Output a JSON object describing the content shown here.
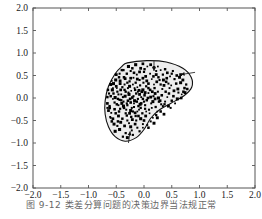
{
  "figure": {
    "background_color": "#ffffff",
    "frame_color": "#555555",
    "region_fill_color": "#ededed",
    "region_stroke_color": "#111111",
    "point_color": "#000000",
    "arrow_color": "#111111"
  },
  "caption": {
    "text": "图 9-12  类差分算问题的决策边界当法规正常"
  },
  "chart_data": {
    "type": "scatter",
    "title": "",
    "xlabel": "",
    "ylabel": "",
    "xlim": [
      -2.0,
      2.0
    ],
    "ylim": [
      -2.0,
      2.0
    ],
    "grid": false,
    "legend": "none",
    "xticks": [
      -2.0,
      -1.5,
      -1.0,
      -0.5,
      0.0,
      0.5,
      1.0,
      1.5,
      2.0
    ],
    "yticks": [
      -2.0,
      -1.5,
      -1.0,
      -0.5,
      0.0,
      0.5,
      1.0,
      1.5,
      2.0
    ],
    "xticklabels": [
      "-2.0",
      "-1.5",
      "-1.0",
      "-0.5",
      "0.0",
      "0.5",
      "1.0",
      "1.5",
      "2.0"
    ],
    "yticklabels": [
      "-2.0",
      "-1.5",
      "-1.0",
      "-0.5",
      "0.0",
      "0.5",
      "1.0",
      "1.5",
      "2.0"
    ],
    "annotations": [
      {
        "name": "boundary-arrow-top",
        "x": 0.18,
        "y": 0.82,
        "dx": 0.0,
        "dy": -0.22
      },
      {
        "name": "boundary-arrow-right",
        "x": 0.92,
        "y": 0.57,
        "dx": -0.26,
        "dy": -0.05
      },
      {
        "name": "boundary-arrow-bottom",
        "x": -0.28,
        "y": -1.0,
        "dx": 0.03,
        "dy": 0.26
      }
    ],
    "region": {
      "name": "decision-region",
      "shape": "kidney",
      "fill": "#ededed",
      "outline_points": [
        [
          -0.3,
          0.78
        ],
        [
          0.05,
          0.83
        ],
        [
          0.4,
          0.8
        ],
        [
          0.7,
          0.66
        ],
        [
          0.85,
          0.46
        ],
        [
          0.86,
          0.24
        ],
        [
          0.72,
          0.05
        ],
        [
          0.48,
          -0.12
        ],
        [
          0.28,
          -0.26
        ],
        [
          0.12,
          -0.45
        ],
        [
          0.0,
          -0.7
        ],
        [
          -0.14,
          -0.88
        ],
        [
          -0.34,
          -0.96
        ],
        [
          -0.52,
          -0.86
        ],
        [
          -0.64,
          -0.64
        ],
        [
          -0.7,
          -0.36
        ],
        [
          -0.7,
          -0.06
        ],
        [
          -0.64,
          0.26
        ],
        [
          -0.52,
          0.54
        ],
        [
          -0.4,
          0.7
        ]
      ]
    },
    "series": [
      {
        "name": "samples",
        "marker": "square",
        "color": "#000000",
        "count": 252,
        "points": [
          [
            -0.24,
            -0.1
          ],
          [
            -0.17,
            -0.06
          ],
          [
            -0.11,
            -0.02
          ],
          [
            -0.05,
            0.02
          ],
          [
            0.01,
            0.06
          ],
          [
            -0.3,
            -0.16
          ],
          [
            -0.21,
            0.01
          ],
          [
            -0.14,
            0.1
          ],
          [
            -0.07,
            -0.14
          ],
          [
            0.05,
            -0.05
          ],
          [
            -0.36,
            -0.22
          ],
          [
            -0.27,
            0.08
          ],
          [
            -0.18,
            -0.2
          ],
          [
            -0.09,
            0.17
          ],
          [
            0.08,
            0.11
          ],
          [
            -0.41,
            -0.05
          ],
          [
            -0.33,
            0.14
          ],
          [
            -0.24,
            -0.28
          ],
          [
            -0.12,
            0.24
          ],
          [
            0.13,
            -0.12
          ],
          [
            -0.45,
            -0.3
          ],
          [
            -0.38,
            0.02
          ],
          [
            -0.29,
            0.22
          ],
          [
            -0.16,
            -0.33
          ],
          [
            0.17,
            0.04
          ],
          [
            -0.49,
            -0.14
          ],
          [
            -0.42,
            0.18
          ],
          [
            -0.31,
            -0.39
          ],
          [
            -0.2,
            0.3
          ],
          [
            0.21,
            -0.2
          ],
          [
            -0.53,
            -0.25
          ],
          [
            -0.46,
            0.08
          ],
          [
            -0.35,
            0.3
          ],
          [
            -0.23,
            -0.42
          ],
          [
            0.25,
            0.14
          ],
          [
            -0.56,
            -0.02
          ],
          [
            -0.5,
            0.26
          ],
          [
            -0.39,
            -0.46
          ],
          [
            -0.26,
            0.37
          ],
          [
            0.29,
            -0.06
          ],
          [
            -0.59,
            -0.33
          ],
          [
            -0.52,
            0.01
          ],
          [
            -0.43,
            0.38
          ],
          [
            -0.3,
            -0.5
          ],
          [
            0.33,
            0.2
          ],
          [
            -0.62,
            -0.18
          ],
          [
            -0.55,
            0.32
          ],
          [
            -0.47,
            -0.52
          ],
          [
            -0.34,
            0.43
          ],
          [
            0.37,
            -0.14
          ],
          [
            -0.19,
            0.45
          ],
          [
            -0.08,
            0.4
          ],
          [
            0.03,
            0.48
          ],
          [
            0.14,
            0.42
          ],
          [
            0.26,
            0.46
          ],
          [
            -0.13,
            0.52
          ],
          [
            0.0,
            0.58
          ],
          [
            0.11,
            0.54
          ],
          [
            0.22,
            0.6
          ],
          [
            0.34,
            0.52
          ],
          [
            -0.06,
            0.66
          ],
          [
            0.06,
            0.7
          ],
          [
            0.18,
            0.68
          ],
          [
            0.3,
            0.62
          ],
          [
            0.42,
            0.56
          ],
          [
            0.4,
            0.36
          ],
          [
            0.49,
            0.28
          ],
          [
            0.55,
            0.42
          ],
          [
            0.61,
            0.2
          ],
          [
            0.66,
            0.34
          ],
          [
            0.45,
            0.1
          ],
          [
            0.53,
            0.04
          ],
          [
            0.6,
            -0.02
          ],
          [
            0.68,
            0.08
          ],
          [
            0.73,
            0.22
          ],
          [
            0.38,
            -0.08
          ],
          [
            0.44,
            -0.18
          ],
          [
            0.3,
            -0.3
          ],
          [
            0.22,
            -0.38
          ],
          [
            0.12,
            -0.52
          ],
          [
            -0.02,
            -0.58
          ],
          [
            -0.12,
            -0.66
          ],
          [
            -0.22,
            -0.72
          ],
          [
            -0.33,
            -0.78
          ],
          [
            -0.44,
            -0.7
          ],
          [
            -0.54,
            -0.58
          ],
          [
            -0.6,
            -0.44
          ],
          [
            -0.64,
            -0.28
          ],
          [
            -0.66,
            -0.12
          ],
          [
            -0.63,
            0.1
          ],
          [
            -0.58,
            0.38
          ],
          [
            -0.5,
            0.52
          ],
          [
            -0.4,
            0.62
          ],
          [
            -0.28,
            0.7
          ],
          [
            -0.15,
            0.74
          ],
          [
            -0.02,
            0.76
          ],
          [
            0.12,
            0.74
          ],
          [
            0.25,
            0.7
          ],
          [
            0.38,
            0.64
          ],
          [
            0.5,
            0.54
          ],
          [
            -0.25,
            -0.02
          ],
          [
            -0.19,
            0.04
          ],
          [
            -0.13,
            -0.08
          ],
          [
            -0.08,
            0.08
          ],
          [
            -0.02,
            -0.02
          ],
          [
            -0.28,
            0.12
          ],
          [
            -0.22,
            -0.22
          ],
          [
            -0.16,
            0.18
          ],
          [
            -0.1,
            -0.18
          ],
          [
            -0.04,
            0.14
          ],
          [
            0.02,
            -0.16
          ],
          [
            0.07,
            0.0
          ],
          [
            0.11,
            0.18
          ],
          [
            0.16,
            -0.08
          ],
          [
            0.2,
            0.1
          ],
          [
            -0.34,
            0.04
          ],
          [
            -0.31,
            -0.12
          ],
          [
            -0.37,
            -0.18
          ],
          [
            -0.43,
            -0.24
          ],
          [
            -0.48,
            0.14
          ],
          [
            -0.26,
            0.26
          ],
          [
            -0.2,
            -0.3
          ],
          [
            -0.15,
            0.34
          ],
          [
            0.04,
            0.26
          ],
          [
            0.09,
            -0.26
          ],
          [
            -0.46,
            -0.4
          ],
          [
            -0.39,
            0.24
          ],
          [
            -0.33,
            -0.34
          ],
          [
            0.18,
            0.3
          ],
          [
            0.24,
            -0.3
          ],
          [
            -0.56,
            -0.46
          ],
          [
            -0.51,
            0.4
          ],
          [
            -0.45,
            0.46
          ],
          [
            0.32,
            0.06
          ],
          [
            0.36,
            0.28
          ],
          [
            -0.6,
            0.04
          ],
          [
            -0.57,
            0.18
          ],
          [
            -0.53,
            -0.1
          ],
          [
            0.41,
            0.44
          ],
          [
            0.47,
            0.48
          ],
          [
            -0.09,
            -0.26
          ],
          [
            -0.03,
            -0.34
          ],
          [
            0.03,
            -0.4
          ],
          [
            0.1,
            -0.34
          ],
          [
            0.16,
            -0.44
          ],
          [
            -0.15,
            -0.4
          ],
          [
            -0.21,
            -0.48
          ],
          [
            -0.27,
            -0.56
          ],
          [
            -0.35,
            -0.62
          ],
          [
            -0.42,
            -0.54
          ],
          [
            -0.48,
            -0.62
          ],
          [
            -0.52,
            -0.74
          ],
          [
            -0.38,
            -0.86
          ],
          [
            -0.3,
            -0.88
          ],
          [
            -0.2,
            -0.82
          ],
          [
            0.54,
            0.16
          ],
          [
            0.58,
            0.32
          ],
          [
            0.64,
            0.46
          ],
          [
            0.7,
            0.4
          ],
          [
            0.76,
            0.3
          ],
          [
            0.5,
            -0.06
          ],
          [
            0.56,
            -0.12
          ],
          [
            0.42,
            0.02
          ],
          [
            0.34,
            -0.18
          ],
          [
            0.27,
            -0.08
          ],
          [
            -0.01,
            0.34
          ],
          [
            0.05,
            0.38
          ],
          [
            -0.07,
            0.28
          ],
          [
            -0.12,
            0.42
          ],
          [
            -0.18,
            0.56
          ],
          [
            -0.24,
            0.6
          ],
          [
            -0.31,
            0.54
          ],
          [
            -0.36,
            0.46
          ],
          [
            -0.43,
            0.32
          ],
          [
            -0.49,
            0.22
          ],
          [
            -0.06,
            -0.46
          ],
          [
            0.0,
            -0.5
          ],
          [
            0.06,
            -0.6
          ],
          [
            -0.08,
            -0.74
          ],
          [
            -0.16,
            -0.58
          ],
          [
            0.19,
            0.22
          ],
          [
            0.23,
            0.36
          ],
          [
            0.28,
            0.4
          ],
          [
            0.15,
            0.14
          ],
          [
            0.08,
            0.22
          ],
          [
            -0.02,
            0.18
          ],
          [
            0.0,
            -0.08
          ],
          [
            -0.05,
            -0.12
          ],
          [
            -0.11,
            0.14
          ],
          [
            -0.17,
            0.22
          ],
          [
            -0.23,
            0.16
          ],
          [
            -0.29,
            -0.06
          ],
          [
            -0.35,
            0.18
          ],
          [
            -0.41,
            0.08
          ],
          [
            -0.47,
            -0.02
          ],
          [
            0.62,
            0.12
          ],
          [
            0.67,
            0.0
          ],
          [
            0.71,
            0.14
          ],
          [
            0.59,
            0.5
          ],
          [
            0.52,
            0.6
          ],
          [
            -0.55,
            0.1
          ],
          [
            -0.61,
            -0.42
          ],
          [
            -0.58,
            -0.52
          ],
          [
            -0.44,
            -0.04
          ],
          [
            -0.4,
            -0.12
          ],
          [
            -0.12,
            -0.3
          ],
          [
            -0.06,
            -0.22
          ],
          [
            0.02,
            -0.24
          ],
          [
            0.14,
            -0.22
          ],
          [
            0.2,
            -0.02
          ],
          [
            0.26,
            0.0
          ],
          [
            0.31,
            -0.14
          ],
          [
            0.39,
            0.14
          ],
          [
            0.46,
            0.22
          ],
          [
            0.12,
            0.02
          ],
          [
            -0.02,
            0.44
          ],
          [
            -0.14,
            -0.5
          ],
          [
            -0.26,
            -0.34
          ],
          [
            -0.32,
            -0.26
          ],
          [
            -0.37,
            -0.08
          ],
          [
            0.08,
            0.32
          ],
          [
            0.17,
            0.48
          ],
          [
            0.22,
            0.52
          ],
          [
            0.3,
            0.3
          ],
          [
            0.35,
            0.4
          ],
          [
            -0.44,
            0.54
          ],
          [
            -0.37,
            0.62
          ],
          [
            -0.21,
            0.66
          ],
          [
            -0.08,
            0.58
          ],
          [
            0.01,
            0.64
          ],
          [
            -0.46,
            -0.16
          ],
          [
            -0.51,
            -0.34
          ],
          [
            -0.62,
            -0.22
          ],
          [
            -0.66,
            0.02
          ],
          [
            -0.65,
            0.18
          ],
          [
            -0.3,
            0.34
          ],
          [
            -0.24,
            0.44
          ],
          [
            -0.18,
            -0.12
          ],
          [
            -0.1,
            -0.4
          ],
          [
            0.04,
            -0.3
          ],
          [
            0.24,
            -0.44
          ],
          [
            0.18,
            -0.56
          ],
          [
            0.08,
            -0.66
          ],
          [
            -0.02,
            -0.66
          ],
          [
            -0.24,
            -0.64
          ],
          [
            0.66,
            0.52
          ],
          [
            0.74,
            0.12
          ],
          [
            0.78,
            0.2
          ],
          [
            0.44,
            0.32
          ],
          [
            0.48,
            -0.22
          ],
          [
            -0.56,
            0.22
          ],
          [
            -0.6,
            0.3
          ],
          [
            -0.66,
            -0.22
          ],
          [
            0.36,
            -0.36
          ],
          [
            0.02,
            0.12
          ]
        ]
      }
    ]
  }
}
